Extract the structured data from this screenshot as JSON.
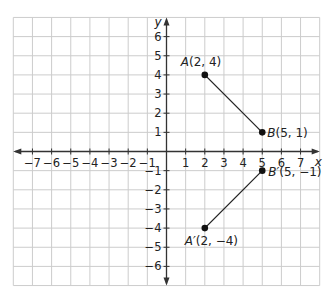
{
  "diagram": {
    "type": "coordinate-plane",
    "x_axis_label": "x",
    "y_axis_label": "y",
    "x_range": [
      -8,
      8
    ],
    "y_range": [
      -7,
      7
    ],
    "x_tick_labels": [
      "-7",
      "-6",
      "-5",
      "-4",
      "-3",
      "-2",
      "-1",
      "1",
      "2",
      "3",
      "4",
      "5",
      "6",
      "7"
    ],
    "y_tick_labels": [
      "6",
      "5",
      "4",
      "3",
      "2",
      "1",
      "-1",
      "-2",
      "-3",
      "-4",
      "-5",
      "-6"
    ],
    "points": [
      {
        "name": "A",
        "x": 2,
        "y": 4,
        "label": "A(2, 4)"
      },
      {
        "name": "B",
        "x": 5,
        "y": 1,
        "label": "B(5, 1)"
      },
      {
        "name": "A'",
        "x": 2,
        "y": -4,
        "label": "A′(2, −4)"
      },
      {
        "name": "B'",
        "x": 5,
        "y": -1,
        "label": "B′(5, −1)"
      }
    ],
    "segments": [
      {
        "from": "A",
        "to": "B"
      },
      {
        "from": "A'",
        "to": "B'"
      }
    ],
    "colors": {
      "grid": "#cccccc",
      "axis": "#333333",
      "segment": "#222222",
      "point": "#111111"
    }
  }
}
